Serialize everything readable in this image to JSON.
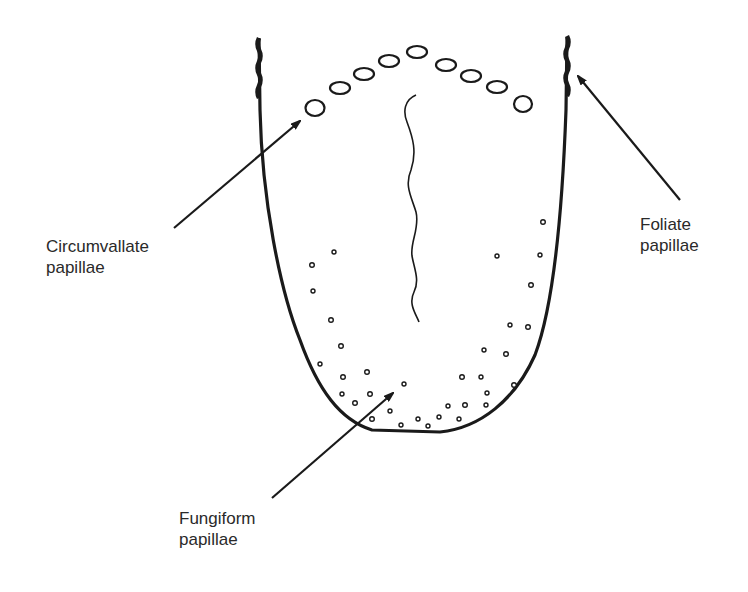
{
  "diagram": {
    "colors": {
      "stroke": "#1a1a1a",
      "text": "#2a2a2a",
      "background": "#ffffff"
    }
  },
  "labels": {
    "circumvallate": {
      "line1": "Circumvallate",
      "line2": "papillae"
    },
    "foliate": {
      "line1": "Foliate",
      "line2": "papillae"
    },
    "fungiform": {
      "line1": "Fungiform",
      "line2": "papillae"
    }
  }
}
